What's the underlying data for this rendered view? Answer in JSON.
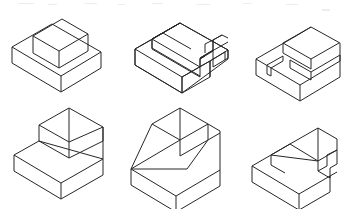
{
  "sheet": {
    "title": "Isometric pictorial drawings of six machined block solids",
    "background_color": "#ffffff",
    "line_color": "#262626",
    "face_color": "#ffffff",
    "width": 348,
    "height": 209,
    "rows": 2,
    "columns": 3,
    "item_count": 6
  },
  "figures": [
    {
      "id": "figure-1",
      "position": "top-left",
      "name": "base slab with centered raised block",
      "description": "Rectangular base plate supporting a smaller rectangular block set back from the front edges."
    },
    {
      "id": "figure-2",
      "position": "top-center",
      "name": "base slab with stepped rib and notch",
      "description": "Rectangular base plate with a raised rib along the rear that is interrupted by a rectangular notch at the right."
    },
    {
      "id": "figure-3",
      "position": "top-right",
      "name": "base slab with raised step and longitudinal groove",
      "description": "Rectangular base plate carrying a raised rear step, with a narrow groove channel running along the top toward the left front corner."
    },
    {
      "id": "figure-4",
      "position": "bottom-left",
      "name": "base slab with angled chamfer block",
      "description": "Rectangular base plate with a raised block whose right hand face is cut away as an inclined chamfer."
    },
    {
      "id": "figure-5",
      "position": "bottom-center",
      "name": "base slab with inclined wedge ramp",
      "description": "Rectangular base plate with a tall wedge whose front face slopes down to the left front corner of the plate."
    },
    {
      "id": "figure-6",
      "position": "bottom-right",
      "name": "base slab with chamfered rib and end notch",
      "description": "Rectangular base plate with a raised rib having an inclined left end and a rectangular notch cut at the right end."
    }
  ]
}
